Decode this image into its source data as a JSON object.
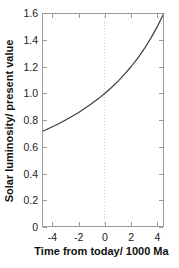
{
  "figure": {
    "background": "#ffffff"
  },
  "colors": {
    "frame": "#9a9a9a",
    "tick": "#9a9a9a",
    "tick_text": "#222222",
    "label_text": "#111111",
    "curve": "#3d3d3d",
    "reference_line": "#cfcfcf"
  },
  "chart_data": {
    "type": "line",
    "title": "",
    "xlabel": "Time from today/ 1000 Ma",
    "ylabel": "Solar luminosity/ present value",
    "xlim": [
      -4.8,
      4.5
    ],
    "ylim": [
      0,
      1.6
    ],
    "grid": false,
    "legend": "none",
    "x_ticks": [
      {
        "value": -4,
        "label": "-4"
      },
      {
        "value": -2,
        "label": "-2"
      },
      {
        "value": 0,
        "label": "0"
      },
      {
        "value": 2,
        "label": "2"
      },
      {
        "value": 4,
        "label": "4"
      }
    ],
    "y_ticks": [
      {
        "value": 0,
        "label": "0"
      },
      {
        "value": 0.2,
        "label": "0.2"
      },
      {
        "value": 0.4,
        "label": "0.4"
      },
      {
        "value": 0.6,
        "label": "0.6"
      },
      {
        "value": 0.8,
        "label": "0.8"
      },
      {
        "value": 1.0,
        "label": "1.0"
      },
      {
        "value": 1.2,
        "label": "1.2"
      },
      {
        "value": 1.4,
        "label": "1.4"
      },
      {
        "value": 1.6,
        "label": "1.6"
      }
    ],
    "reference_line": {
      "x": 0,
      "style": "dotted"
    },
    "series": [
      {
        "name": "solar-luminosity-relative-to-present",
        "x": [
          -4.8,
          -4.5,
          -4,
          -3.5,
          -3,
          -2.5,
          -2,
          -1.5,
          -1,
          -0.5,
          0,
          0.5,
          1,
          1.5,
          2,
          2.5,
          3,
          3.5,
          4,
          4.5
        ],
        "y": [
          0.714,
          0.727,
          0.75,
          0.774,
          0.8,
          0.828,
          0.857,
          0.889,
          0.923,
          0.96,
          1.0,
          1.043,
          1.091,
          1.143,
          1.2,
          1.263,
          1.333,
          1.412,
          1.5,
          1.6
        ]
      }
    ]
  }
}
